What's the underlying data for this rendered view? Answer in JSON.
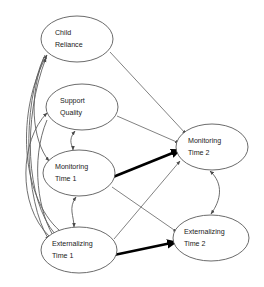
{
  "figure": {
    "type": "path-diagram",
    "background_color": "#ffffff",
    "line_color": "#6b6b6b",
    "bold_line_color": "#000000",
    "node_fill": "#ffffff",
    "node_stroke": "#5a5a5a",
    "text_color": "#1a1a1a"
  },
  "nodes": [
    {
      "id": "child-reliance",
      "line1": "Child",
      "line2": "Reliance",
      "cx": 77,
      "cy": 39,
      "rx": 36,
      "ry": 23
    },
    {
      "id": "support-quality",
      "line1": "Support",
      "line2": "Quality",
      "cx": 82,
      "cy": 107,
      "rx": 36,
      "ry": 23
    },
    {
      "id": "monitoring-time-1",
      "line1": "Monitoring",
      "line2": "Time 1",
      "cx": 79,
      "cy": 173,
      "rx": 36,
      "ry": 23
    },
    {
      "id": "monitoring-time-2",
      "line1": "Monitoring",
      "line2": "Time 2",
      "cx": 212,
      "cy": 147,
      "rx": 36,
      "ry": 23
    },
    {
      "id": "externalizing-time-1",
      "line1": "Externalizing",
      "line2": "Time 1",
      "cx": 79,
      "cy": 250,
      "rx": 38,
      "ry": 23
    },
    {
      "id": "externalizing-time-2",
      "line1": "Externalizing",
      "line2": "Time 2",
      "cx": 211,
      "cy": 238,
      "rx": 38,
      "ry": 23
    }
  ],
  "edges": [
    {
      "id": "child-reliance-to-monitoring-time-2",
      "from": "child-reliance",
      "to": "monitoring-time-2",
      "style": "thin",
      "kind": "directed"
    },
    {
      "id": "support-quality-to-monitoring-time-2",
      "from": "support-quality",
      "to": "monitoring-time-2",
      "style": "thin",
      "kind": "directed"
    },
    {
      "id": "monitoring-time-1-to-monitoring-time-2",
      "from": "monitoring-time-1",
      "to": "monitoring-time-2",
      "style": "bold",
      "kind": "directed"
    },
    {
      "id": "externalizing-time-1-to-externalizing-time-2",
      "from": "externalizing-time-1",
      "to": "externalizing-time-2",
      "style": "bold",
      "kind": "directed"
    },
    {
      "id": "monitoring-time-1-to-externalizing-time-2",
      "from": "monitoring-time-1",
      "to": "externalizing-time-2",
      "style": "thin",
      "kind": "directed"
    },
    {
      "id": "externalizing-time-1-to-monitoring-time-2",
      "from": "externalizing-time-1",
      "to": "monitoring-time-2",
      "style": "thin",
      "kind": "directed"
    },
    {
      "id": "externalizing-time-1-to-child-reliance",
      "from": "externalizing-time-1",
      "to": "child-reliance",
      "style": "thin",
      "kind": "directed-curved"
    },
    {
      "id": "externalizing-time-1-to-support-quality",
      "from": "externalizing-time-1",
      "to": "support-quality",
      "style": "thin",
      "kind": "directed-curved"
    },
    {
      "id": "child-reliance-to-externalizing-time-1",
      "from": "child-reliance",
      "to": "externalizing-time-1",
      "style": "thin",
      "kind": "directed-curved"
    },
    {
      "id": "support-quality-to-externalizing-time-1",
      "from": "support-quality",
      "to": "externalizing-time-1",
      "style": "thin",
      "kind": "directed-curved"
    },
    {
      "id": "child-reliance-to-monitoring-time-1",
      "from": "child-reliance",
      "to": "monitoring-time-1",
      "style": "thin",
      "kind": "directed-curved"
    },
    {
      "id": "support-quality-with-monitoring-time-1",
      "from": "support-quality",
      "to": "monitoring-time-1",
      "style": "thin",
      "kind": "bidirectional-curved"
    },
    {
      "id": "monitoring-time-1-with-externalizing-time-1",
      "from": "monitoring-time-1",
      "to": "externalizing-time-1",
      "style": "thin",
      "kind": "bidirectional-curved"
    },
    {
      "id": "monitoring-time-2-with-externalizing-time-2",
      "from": "monitoring-time-2",
      "to": "externalizing-time-2",
      "style": "thin",
      "kind": "bidirectional-curved"
    }
  ]
}
